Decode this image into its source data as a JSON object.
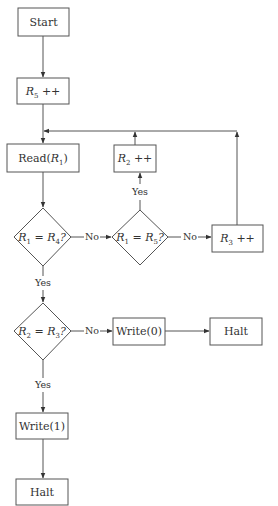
{
  "diagram": {
    "type": "flowchart",
    "nodes": {
      "start": {
        "id": "start",
        "shape": "rect",
        "label": "Start"
      },
      "inc_r5": {
        "id": "inc_r5",
        "shape": "rect",
        "label": "R5 ++",
        "var": "R",
        "sub": "5",
        "op": " ++"
      },
      "read_r1": {
        "id": "read_r1",
        "shape": "rect",
        "label": "Read(R1)",
        "pre": "Read(",
        "var": "R",
        "sub": "1",
        "post": ")"
      },
      "inc_r2": {
        "id": "inc_r2",
        "shape": "rect",
        "label": "R2 ++",
        "var": "R",
        "sub": "2",
        "op": " ++"
      },
      "dec_r1_r4": {
        "id": "dec_r1_r4",
        "shape": "diamond",
        "label": "R1 = R4?",
        "lhs_var": "R",
        "lhs_sub": "1",
        "eq": " = ",
        "rhs_var": "R",
        "rhs_sub": "4",
        "q": "?"
      },
      "dec_r1_r5": {
        "id": "dec_r1_r5",
        "shape": "diamond",
        "label": "R1 = R5?",
        "lhs_var": "R",
        "lhs_sub": "1",
        "eq": " = ",
        "rhs_var": "R",
        "rhs_sub": "5",
        "q": "?"
      },
      "inc_r3": {
        "id": "inc_r3",
        "shape": "rect",
        "label": "R3 ++",
        "var": "R",
        "sub": "3",
        "op": " ++"
      },
      "dec_r2_r3": {
        "id": "dec_r2_r3",
        "shape": "diamond",
        "label": "R2 = R3?",
        "lhs_var": "R",
        "lhs_sub": "2",
        "eq": " = ",
        "rhs_var": "R",
        "rhs_sub": "3",
        "q": "?"
      },
      "write0": {
        "id": "write0",
        "shape": "rect",
        "label": "Write(0)"
      },
      "halt_right": {
        "id": "halt_right",
        "shape": "rect",
        "label": "Halt"
      },
      "write1": {
        "id": "write1",
        "shape": "rect",
        "label": "Write(1)"
      },
      "halt_bottom": {
        "id": "halt_bottom",
        "shape": "rect",
        "label": "Halt"
      }
    },
    "edges": [
      {
        "from": "start",
        "to": "inc_r5",
        "label": ""
      },
      {
        "from": "inc_r5",
        "to": "read_r1",
        "label": ""
      },
      {
        "from": "read_r1",
        "to": "dec_r1_r4",
        "label": ""
      },
      {
        "from": "dec_r1_r4",
        "to": "dec_r1_r5",
        "label": "No"
      },
      {
        "from": "dec_r1_r4",
        "to": "dec_r2_r3",
        "label": "Yes"
      },
      {
        "from": "dec_r1_r5",
        "to": "inc_r2",
        "label": "Yes"
      },
      {
        "from": "dec_r1_r5",
        "to": "inc_r3",
        "label": "No"
      },
      {
        "from": "inc_r2",
        "to": "read_r1",
        "label": ""
      },
      {
        "from": "inc_r3",
        "to": "read_r1",
        "label": ""
      },
      {
        "from": "dec_r2_r3",
        "to": "write0",
        "label": "No"
      },
      {
        "from": "dec_r2_r3",
        "to": "write1",
        "label": "Yes"
      },
      {
        "from": "write0",
        "to": "halt_right",
        "label": ""
      },
      {
        "from": "write1",
        "to": "halt_bottom",
        "label": ""
      }
    ],
    "edge_labels": {
      "yes": "Yes",
      "no": "No"
    },
    "colors": {
      "stroke": "#555555",
      "text": "#333333",
      "background": "#ffffff"
    }
  }
}
